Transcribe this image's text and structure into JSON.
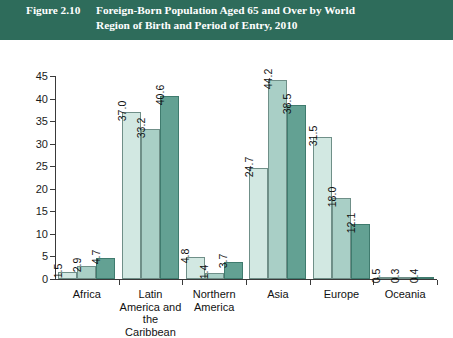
{
  "banner": {
    "figure_number": "Figure 2.10",
    "title_line1": "Foreign-Born Population Aged 65 and Over by World",
    "title_line2": "Region of Birth and Period of Entry, 2010",
    "background_color": "#2e6c5b",
    "text_color": "#ffffff"
  },
  "chart_data": {
    "type": "bar",
    "title": "Foreign-Born Population Aged 65 and Over by World Region of Birth and Period of Entry, 2010",
    "xlabel": "",
    "ylabel": "",
    "ylim": [
      0,
      45
    ],
    "yticks": [
      0,
      5,
      10,
      15,
      20,
      25,
      30,
      35,
      40,
      45
    ],
    "grid": false,
    "legend_position": "bottom",
    "categories": [
      "Africa",
      "Latin America and the Caribbean",
      "Northern America",
      "Asia",
      "Europe",
      "Oceania"
    ],
    "category_lines": [
      [
        "Africa"
      ],
      [
        "Latin",
        "America and",
        "the Caribbean"
      ],
      [
        "Northern",
        "America"
      ],
      [
        "Asia"
      ],
      [
        "Europe"
      ],
      [
        "Oceania"
      ]
    ],
    "series": [
      {
        "name": "Prior to 1990",
        "color": "#d2e8e2",
        "values": [
          1.5,
          37.0,
          4.8,
          24.7,
          31.5,
          0.5
        ],
        "labels": [
          "1.5",
          "37.0",
          "4.8",
          "24.7",
          "31.5",
          "0.5"
        ]
      },
      {
        "name": "1990 to 1999",
        "color": "#a9cfc6",
        "values": [
          2.9,
          33.2,
          1.4,
          44.2,
          18.0,
          0.3
        ],
        "labels": [
          "2.9",
          "33.2",
          "1.4",
          "44.2",
          "18.0",
          "0.3"
        ]
      },
      {
        "name": "2000 to 2010",
        "color": "#63a193",
        "values": [
          4.7,
          40.6,
          3.7,
          38.5,
          12.1,
          0.4
        ],
        "labels": [
          "4.7",
          "40.6",
          "3.7",
          "38.5",
          "12.1",
          "0.4"
        ]
      }
    ]
  }
}
